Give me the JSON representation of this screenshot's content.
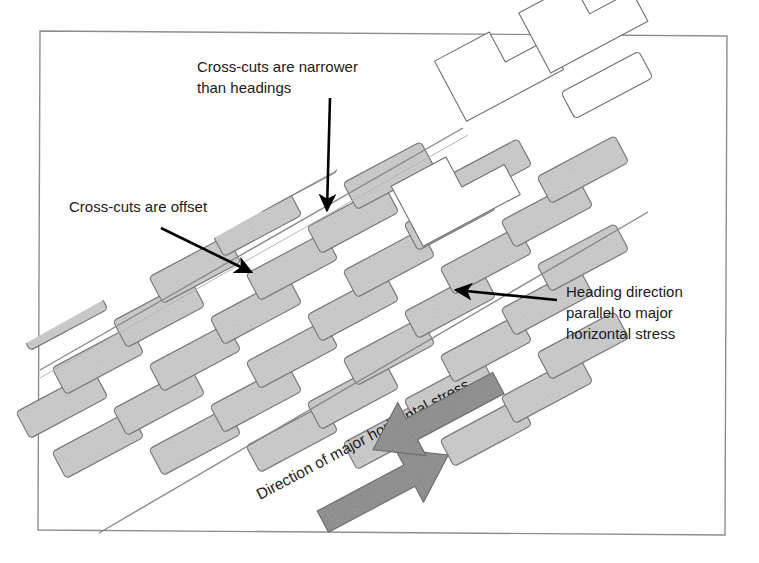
{
  "figure": {
    "kind": "mine-layout-diagram",
    "background_color": "#ffffff",
    "frame": {
      "stroke_color": "#777777",
      "fill_color": "#ffffff",
      "points": "40,31 727,36 725,535 38,530"
    }
  },
  "annotations": [
    {
      "id": "cross-cuts-narrower",
      "lines": [
        "Cross-cuts are narrower",
        "than headings"
      ],
      "text_x": 197,
      "text_y": 72,
      "anchor": "start",
      "arrow": {
        "x1": 330,
        "y1": 98,
        "x2": 327,
        "y2": 210
      }
    },
    {
      "id": "cross-cuts-offset",
      "lines": [
        "Cross-cuts are offset"
      ],
      "text_x": 69,
      "text_y": 212,
      "anchor": "start",
      "arrow": {
        "x1": 161,
        "y1": 228,
        "x2": 250,
        "y2": 271
      }
    },
    {
      "id": "heading-direction",
      "lines": [
        "Heading direction",
        "parallel to major",
        "horizontal stress"
      ],
      "text_x": 566,
      "text_y": 297,
      "anchor": "start",
      "arrow": {
        "x1": 556,
        "y1": 300,
        "x2": 455,
        "y2": 290
      }
    }
  ],
  "stress_label": {
    "text": "Direction of major horizontal stress",
    "x": 260,
    "y": 500,
    "rotation_deg": -28
  },
  "stress_arrows": {
    "fill_color": "#8f8f8f",
    "stroke_color": "#6e6e6e",
    "description": "double-headed compression arrow pair"
  },
  "colors": {
    "pillar_fill": "#c9c9c9",
    "pillar_stroke": "#7a7a7a",
    "face_outline_stroke": "#6f6f6f",
    "face_outline_fill": "#ffffff",
    "panel_line": "#8a8a8a",
    "arrow_color": "#000000",
    "text_color": "#1a1a1a"
  },
  "geometry": {
    "pillar_rotation_deg": -28,
    "pillar_width": 88,
    "pillar_height": 30,
    "pillar_corner_radius": 4,
    "row_count": 7,
    "pillar_rows": [
      {
        "start_x": 52,
        "start_y": 452,
        "count": 5,
        "step_x": 97,
        "step_y": -3,
        "offset": 0
      },
      {
        "start_x": 30,
        "start_y": 408,
        "count": 6,
        "step_x": 97,
        "step_y": -3,
        "offset": 1
      },
      {
        "start_x": 66,
        "start_y": 362,
        "count": 6,
        "step_x": 97,
        "step_y": -3,
        "offset": 0
      },
      {
        "start_x": 44,
        "start_y": 318,
        "count": 6,
        "step_x": 97,
        "step_y": -3,
        "offset": 1
      },
      {
        "start_x": 80,
        "start_y": 272,
        "count": 6,
        "step_x": 97,
        "step_y": -3,
        "offset": 0
      },
      {
        "start_x": 168,
        "start_y": 232,
        "count": 5,
        "step_x": 97,
        "step_y": -3,
        "offset": 1
      },
      {
        "start_x": 258,
        "start_y": 190,
        "count": 4,
        "step_x": 97,
        "step_y": -3,
        "offset": 0
      }
    ]
  },
  "panel_lines": {
    "upper_edge": "44,357 455,128",
    "lower_edge": "100,533 640,218"
  },
  "face_outlines": {
    "count": 7,
    "note": "stepped Z-shaped unmined face outlines along upper right"
  }
}
